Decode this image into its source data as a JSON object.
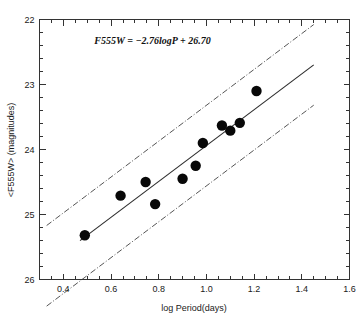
{
  "chart_data": {
    "type": "scatter",
    "title": "",
    "xlabel": "log Period(days)",
    "ylabel": "<F555W> (magnitudes)",
    "xlim": [
      0.3,
      1.6
    ],
    "ylim": [
      26.0,
      22.0
    ],
    "y_inverted": true,
    "grid": false,
    "legend": "none",
    "xticks": [
      0.4,
      0.6,
      0.8,
      1.0,
      1.2,
      1.4,
      1.6
    ],
    "xtick_labels": [
      "0.4",
      "0.6",
      "0.8",
      "1.0",
      "1.2",
      "1.4",
      "1.6"
    ],
    "xtick_minor_step": 0.05,
    "yticks": [
      22,
      23,
      24,
      25,
      26
    ],
    "ytick_labels": [
      "22",
      "23",
      "24",
      "25",
      "26"
    ],
    "ytick_minor_step": 0.2,
    "annotation": "F555W  =  −2.76logP  +  26.70",
    "annotation_x": 0.53,
    "annotation_y": 22.38,
    "fit": {
      "slope": -2.76,
      "intercept": 26.7,
      "x_start": 0.47,
      "x_end": 1.45
    },
    "bands": [
      {
        "name": "upper-band",
        "offset": -0.62,
        "x_start": 0.33,
        "x_end": 1.45
      },
      {
        "name": "lower-band",
        "offset": 0.62,
        "x_start": 0.33,
        "x_end": 1.45
      }
    ],
    "points": [
      {
        "x": 0.49,
        "y": 25.32
      },
      {
        "x": 0.64,
        "y": 24.71
      },
      {
        "x": 0.745,
        "y": 24.5
      },
      {
        "x": 0.785,
        "y": 24.84
      },
      {
        "x": 0.9,
        "y": 24.45
      },
      {
        "x": 0.955,
        "y": 24.25
      },
      {
        "x": 0.985,
        "y": 23.9
      },
      {
        "x": 1.065,
        "y": 23.63
      },
      {
        "x": 1.1,
        "y": 23.71
      },
      {
        "x": 1.14,
        "y": 23.59
      },
      {
        "x": 1.21,
        "y": 23.1
      }
    ],
    "marker": {
      "shape": "circle",
      "size": 5.2,
      "color": "#080808"
    },
    "colors": {
      "fit_line": "#2b2b2b",
      "band_line": "#555555",
      "axis": "#333333",
      "text": "#1a1a1a",
      "background": "#ffffff"
    }
  }
}
